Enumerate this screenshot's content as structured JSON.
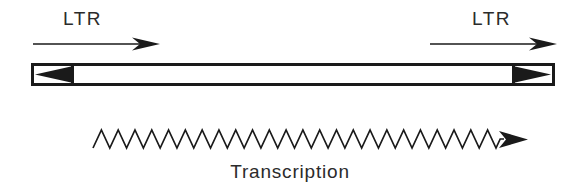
{
  "figure": {
    "title_caption": "Transcription",
    "labels": {
      "ltr_left": "LTR",
      "ltr_right": "LTR"
    },
    "colors": {
      "ink": "#1a1a1a",
      "background": "#ffffff",
      "text": "#2b2b2b"
    },
    "elements": {
      "provirus_bar": {
        "name": "provirus-genome-bar",
        "x": 31,
        "y": 63,
        "width": 524,
        "height": 23,
        "stroke_width": 3,
        "fill": "#ffffff"
      },
      "ltr_box_left": {
        "name": "ltr-box-left",
        "x": 31,
        "y": 63,
        "width": 41,
        "height": 23,
        "triangle_direction": "left"
      },
      "ltr_box_right": {
        "name": "ltr-box-right",
        "x": 514,
        "y": 63,
        "width": 41,
        "height": 23,
        "triangle_direction": "right"
      },
      "ltr_arrow_left": {
        "name": "ltr-orientation-arrow-left",
        "x1": 33,
        "x2": 158,
        "y": 44,
        "direction": "right"
      },
      "ltr_arrow_right": {
        "name": "ltr-orientation-arrow-right",
        "x1": 430,
        "x2": 555,
        "y": 44,
        "direction": "right"
      },
      "transcript_zigzag": {
        "name": "rna-transcript-zigzag",
        "x_start": 93,
        "x_end": 496,
        "y_center": 139,
        "amplitude": 9,
        "teeth": 48,
        "arrow_tip_x": 526,
        "direction": "right"
      }
    }
  }
}
